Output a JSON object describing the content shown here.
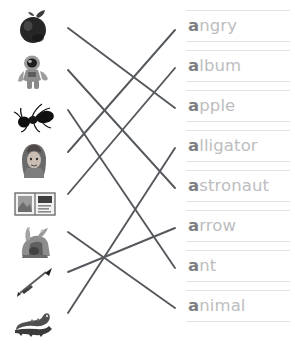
{
  "worksheet": {
    "title": "Letter A Picture-to-Word Matching Worksheet",
    "instruction": "",
    "background_color": "#ffffff",
    "rule_line_color": "#e2e2e4",
    "match_line_color": "#55585c",
    "word_color": "#bdbdc0",
    "initial_letter_color": "#7e8084",
    "initial_letter": "a"
  },
  "pictures": [
    {
      "id": "picture-apple",
      "label": "apple",
      "icon": "apple-photo"
    },
    {
      "id": "picture-astronaut",
      "label": "astronaut",
      "icon": "astronaut-photo"
    },
    {
      "id": "picture-ant",
      "label": "ant",
      "icon": "ant-photo"
    },
    {
      "id": "picture-angry",
      "label": "angry",
      "icon": "angry-girl-photo"
    },
    {
      "id": "picture-album",
      "label": "album",
      "icon": "album-photo"
    },
    {
      "id": "picture-animal",
      "label": "animal",
      "icon": "animal-photo"
    },
    {
      "id": "picture-arrow",
      "label": "arrow",
      "icon": "arrow-photo"
    },
    {
      "id": "picture-alligator",
      "label": "alligator",
      "icon": "alligator-photo"
    }
  ],
  "words": [
    {
      "id": "word-angry",
      "first": "a",
      "rest": "ngry"
    },
    {
      "id": "word-album",
      "first": "a",
      "rest": "lbum"
    },
    {
      "id": "word-apple",
      "first": "a",
      "rest": "pple"
    },
    {
      "id": "word-alligator",
      "first": "a",
      "rest": "lligator"
    },
    {
      "id": "word-astronaut",
      "first": "a",
      "rest": "stronaut"
    },
    {
      "id": "word-arrow",
      "first": "a",
      "rest": "rrow"
    },
    {
      "id": "word-ant",
      "first": "a",
      "rest": "nt"
    },
    {
      "id": "word-animal",
      "first": "a",
      "rest": "nimal"
    }
  ],
  "connections": [
    {
      "id": "line-apple-to-apple",
      "from": "picture-apple",
      "to": "word-apple"
    },
    {
      "id": "line-astronaut-to-astronaut",
      "from": "picture-astronaut",
      "to": "word-astronaut"
    },
    {
      "id": "line-ant-to-ant",
      "from": "picture-ant",
      "to": "word-ant"
    },
    {
      "id": "line-angry-to-angry",
      "from": "picture-angry",
      "to": "word-angry"
    },
    {
      "id": "line-album-to-album",
      "from": "picture-album",
      "to": "word-album"
    },
    {
      "id": "line-animal-to-animal",
      "from": "picture-animal",
      "to": "word-animal"
    },
    {
      "id": "line-arrow-to-arrow",
      "from": "picture-arrow",
      "to": "word-arrow"
    },
    {
      "id": "line-alligator-to-alligator",
      "from": "picture-alligator",
      "to": "word-alligator"
    }
  ]
}
